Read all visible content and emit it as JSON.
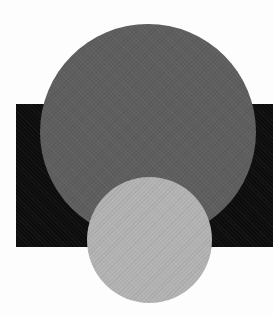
{
  "figure": {
    "background_color": "#fdfdfd",
    "shapes": [
      {
        "name": "black-rectangle",
        "type": "rectangle",
        "color": "#0d0d0d",
        "z_order": 1
      },
      {
        "name": "dark-gray-circle",
        "type": "circle",
        "color": "#5e5e5e",
        "z_order": 2
      },
      {
        "name": "light-gray-circle",
        "type": "circle",
        "color": "#b3b3b3",
        "z_order": 3
      }
    ]
  }
}
